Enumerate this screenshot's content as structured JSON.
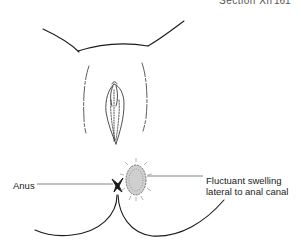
{
  "header": {
    "section": "Section XII",
    "page_number": "161"
  },
  "figure": {
    "labels": {
      "anus": "Anus",
      "swelling_line1": "Fluctuant swelling",
      "swelling_line2": "lateral to anal canal"
    },
    "colors": {
      "line": "#1a1a1a",
      "background": "#ffffff"
    }
  }
}
